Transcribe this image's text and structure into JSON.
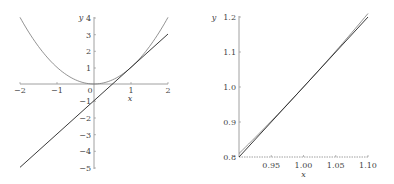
{
  "chart_data": [
    {
      "type": "line",
      "title": "",
      "xlabel": "x",
      "ylabel": "y",
      "xlim": [
        -2,
        2
      ],
      "ylim": [
        -5,
        4
      ],
      "xticks": [
        "−2",
        "−1",
        "0",
        "1",
        "2"
      ],
      "yticks": [
        "4",
        "3",
        "2",
        "1",
        "−1",
        "−2",
        "−3",
        "−4",
        "−5"
      ],
      "grid": false,
      "legend": null,
      "series": [
        {
          "name": "y = x^2",
          "x": [
            -2,
            -1.5,
            -1,
            -0.5,
            0,
            0.5,
            1,
            1.5,
            2
          ],
          "values": [
            4,
            2.25,
            1,
            0.25,
            0,
            0.25,
            1,
            2.25,
            4
          ]
        },
        {
          "name": "y = 2x - 1 (tangent at x=1)",
          "x": [
            -2,
            2
          ],
          "values": [
            -5,
            3
          ]
        }
      ]
    },
    {
      "type": "line",
      "title": "",
      "xlabel": "x",
      "ylabel": "y",
      "xlim": [
        0.9,
        1.1
      ],
      "ylim": [
        0.8,
        1.2
      ],
      "xticks": [
        "0.95",
        "1.00",
        "1.05",
        "1.10"
      ],
      "yticks": [
        "0.8",
        "0.9",
        "1.0",
        "1.1",
        "1.2"
      ],
      "grid": false,
      "legend": null,
      "series": [
        {
          "name": "y = x^2",
          "x": [
            0.9,
            0.95,
            1.0,
            1.05,
            1.1
          ],
          "values": [
            0.81,
            0.9025,
            1.0,
            1.1025,
            1.21
          ]
        },
        {
          "name": "y = 2x - 1 (tangent at x=1)",
          "x": [
            0.9,
            1.1
          ],
          "values": [
            0.8,
            1.2
          ]
        }
      ]
    }
  ],
  "labels": {
    "left": {
      "x_axis": "x",
      "y_axis": "y",
      "xticks": [
        "−2",
        "−1",
        "0",
        "1",
        "2"
      ],
      "yticks": [
        "4",
        "3",
        "2",
        "1",
        "−1",
        "−2",
        "−3",
        "−4",
        "−5"
      ]
    },
    "right": {
      "x_axis": "x",
      "y_axis": "y",
      "xticks": [
        "0.95",
        "1.00",
        "1.05",
        "1.10"
      ],
      "yticks": [
        "1.2",
        "1.1",
        "1.0",
        "0.9",
        "0.8"
      ]
    }
  }
}
